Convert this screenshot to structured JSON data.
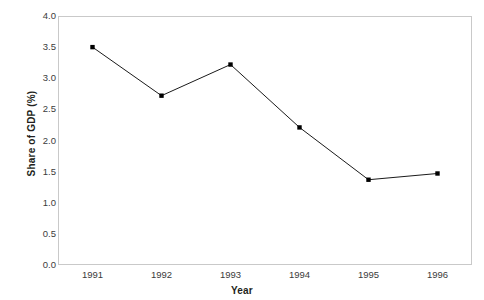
{
  "chart_data": {
    "type": "line",
    "title": "",
    "xlabel": "Year",
    "ylabel": "Share of GDP (%)",
    "categories": [
      "1991",
      "1992",
      "1993",
      "1994",
      "1995",
      "1996"
    ],
    "x": [
      1991,
      1992,
      1993,
      1994,
      1995,
      1996
    ],
    "values": [
      3.5,
      2.72,
      3.22,
      2.21,
      1.37,
      1.47
    ],
    "series": [
      {
        "name": "Share of GDP (%)",
        "values": [
          3.5,
          2.72,
          3.22,
          2.21,
          1.37,
          1.47
        ]
      }
    ],
    "ylim": [
      0.0,
      4.0
    ],
    "y_ticks": [
      "0.0",
      "0.5",
      "1.0",
      "1.5",
      "2.0",
      "2.5",
      "3.0",
      "3.5",
      "4.0"
    ],
    "y_tick_values": [
      0.0,
      0.5,
      1.0,
      1.5,
      2.0,
      2.5,
      3.0,
      3.5,
      4.0
    ],
    "x_tick_labels": [
      "1991",
      "1992",
      "1993",
      "1994",
      "1995",
      "1996"
    ],
    "grid": false,
    "legend": false,
    "legend_position": "none",
    "marker": "square",
    "line_color": "#1a1a1a",
    "marker_color": "#000000",
    "frame_color": "#c9c9c9",
    "background": "#ffffff"
  }
}
